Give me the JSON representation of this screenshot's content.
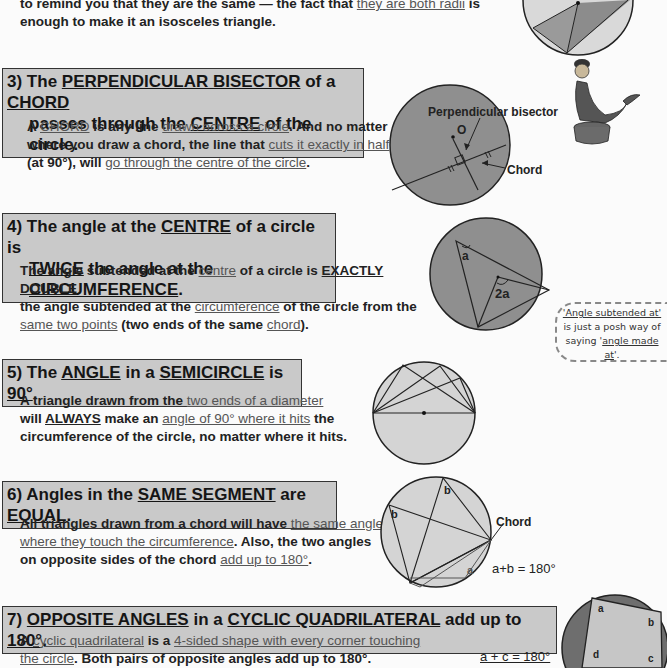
{
  "intro": {
    "line1_pre": "to remind you that they are the same — the fact that ",
    "line1_link": "they are both radii",
    "line1_post": " is",
    "line2": "enough to make it an isosceles triangle."
  },
  "section3": {
    "num": "3)",
    "title_parts": [
      "The ",
      "PERPENDICULAR BISECTOR",
      " of a ",
      "CHORD"
    ],
    "title_line2_parts": [
      "passes through the ",
      "CENTRE",
      " of the circle."
    ],
    "body_parts": [
      "A ",
      "CHORD",
      " is any line ",
      "drawn across a circle",
      ".  And no matter",
      "where you draw a chord, the line that ",
      "cuts it exactly in half",
      "(at 90°), will ",
      "go through the centre of the circle",
      "."
    ],
    "diagram": {
      "label_bisector": "Perpendicular bisector",
      "label_centre": "O",
      "label_chord": "Chord"
    }
  },
  "section4": {
    "num": "4)",
    "title_parts": [
      "The angle at the ",
      "CENTRE",
      " of a circle is"
    ],
    "title_line2_parts": [
      "TWICE",
      " the angle at the ",
      "CIRCUMFERENCE",
      "."
    ],
    "body_parts": [
      "The angle subtended at the ",
      "centre",
      " of a circle is ",
      "EXACTLY DOUBLE",
      "the angle subtended at the ",
      "circumference",
      " of the circle from the",
      "same two points",
      " (two ends of the same ",
      "chord",
      ")."
    ],
    "diagram": {
      "label_a": "a",
      "label_2a": "2a"
    }
  },
  "note": {
    "line1": "'Angle subtended at'",
    "line2": "is just a posh way of",
    "line3_pre": "saying '",
    "line3_link": "angle made at",
    "line3_post": "'."
  },
  "section5": {
    "num": "5)",
    "title_parts": [
      "The ",
      "ANGLE",
      " in a ",
      "SEMICIRCLE",
      " is ",
      "90°",
      "."
    ],
    "body_parts": [
      "A triangle drawn from the ",
      "two ends of a diameter",
      "will ",
      "ALWAYS",
      " make an ",
      "angle of 90° where it hits",
      " the",
      "circumference of the circle, no matter where it hits."
    ]
  },
  "section6": {
    "num": "6)",
    "title_parts": [
      "Angles in the ",
      "SAME SEGMENT",
      " are ",
      "EQUAL",
      "."
    ],
    "body_parts": [
      "All triangles drawn from a chord will have ",
      "the same angle",
      "where they touch the circumference",
      ".  Also, the two angles",
      "on opposite sides of the chord ",
      "add up to 180°",
      "."
    ],
    "diagram": {
      "label_chord": "Chord",
      "label_b": "b",
      "label_a": "a",
      "equation": "a+b = 180°"
    }
  },
  "section7": {
    "num": "7)",
    "title_parts": [
      "OPPOSITE ANGLES",
      " in a ",
      "CYCLIC QUADRILATERAL",
      " add up to ",
      "180°",
      "."
    ],
    "body_parts": [
      "A ",
      "cyclic quadrilateral",
      " is a ",
      "4-sided shape with every corner touching",
      "the circle",
      ".  Both pairs of opposite angles add up to 180°."
    ],
    "diagram": {
      "labels": [
        "a",
        "b",
        "c",
        "d"
      ],
      "equation": "a + c = 180°"
    }
  },
  "colors": {
    "heading_bg": "#c9c9c9",
    "circle_dark": "#8f8f8f",
    "circle_light": "#d4d4d4",
    "text": "#222222"
  }
}
